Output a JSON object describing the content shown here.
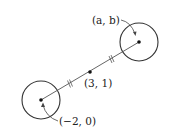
{
  "diagram": {
    "points": {
      "left_center": {
        "label": "(−2, 0)",
        "x": -2,
        "y": 0
      },
      "midpoint": {
        "label": "(3, 1)",
        "x": 3,
        "y": 1
      },
      "right_center": {
        "label": "(a, b)",
        "x": "a",
        "y": "b"
      }
    },
    "tick_mark": "equal-length marks on both segments"
  }
}
